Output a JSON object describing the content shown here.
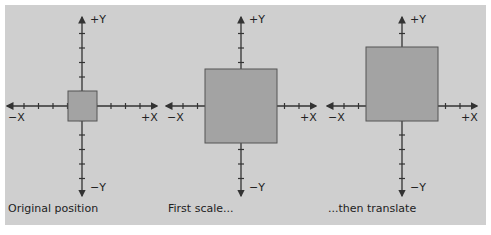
{
  "figure": {
    "background": "#cfcfcf",
    "square_color": "#a3a3a3",
    "axis_labels": {
      "pos_y": "+Y",
      "neg_y": "−Y",
      "pos_x": "+X",
      "neg_x": "−X"
    },
    "panels": [
      {
        "caption": "Original position",
        "origin_x": 82,
        "square": {
          "x": 68,
          "y": 91,
          "w": 29,
          "h": 30
        }
      },
      {
        "caption": "First scale...",
        "origin_x": 241,
        "square": {
          "x": 205,
          "y": 69,
          "w": 72,
          "h": 74
        }
      },
      {
        "caption": "...then translate",
        "origin_x": 402,
        "square": {
          "x": 366,
          "y": 47,
          "w": 72,
          "h": 74
        }
      }
    ]
  }
}
